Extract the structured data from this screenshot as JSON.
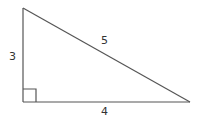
{
  "diagram": {
    "type": "right-triangle",
    "vertices": {
      "top": [
        23,
        8
      ],
      "right_angle": [
        23,
        102
      ],
      "right": [
        190,
        102
      ]
    },
    "right_angle_marker": {
      "x": 23,
      "y": 89,
      "size": 13
    },
    "labels": {
      "vertical_side": "3",
      "horizontal_side": "4",
      "hypotenuse": "5"
    },
    "colors": {
      "stroke": "#555555",
      "text": "#333333"
    }
  }
}
